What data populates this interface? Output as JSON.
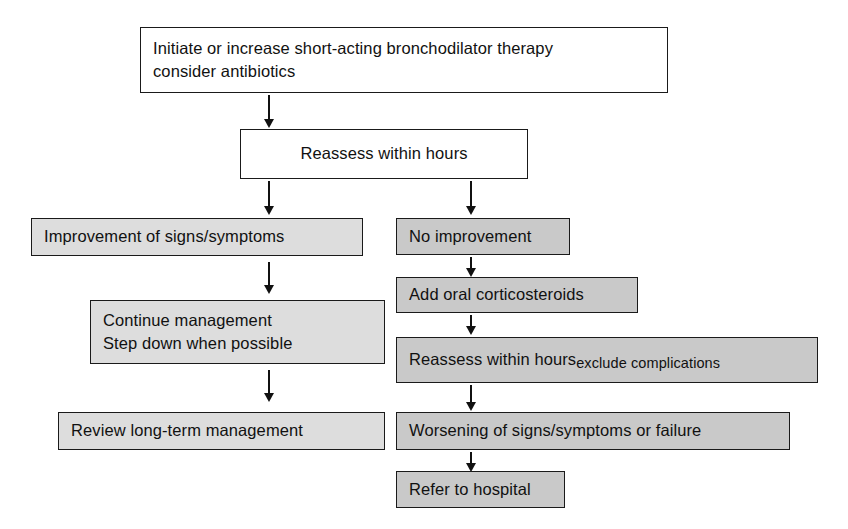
{
  "diagram": {
    "colors": {
      "box_white": "#ffffff",
      "box_light_gray": "#dddddd",
      "box_dark_gray": "#c9c9c9",
      "stroke": "#1a1a1a",
      "text": "#111111",
      "background": "#ffffff"
    },
    "nodes": {
      "start": {
        "line1": "Initiate or increase short-acting bronchodilator therapy",
        "line2": "consider antibiotics"
      },
      "reassess_top": {
        "label": "Reassess within hours"
      },
      "improvement": {
        "label": "Improvement of signs/symptoms"
      },
      "continue_management": {
        "line1": "Continue management",
        "line2": "Step down when possible"
      },
      "review_long_term": {
        "label": "Review long-term management"
      },
      "no_improvement": {
        "label": "No improvement"
      },
      "add_corticosteroids": {
        "label": "Add oral corticosteroids"
      },
      "reassess_exclude": {
        "main": "Reassess within hours",
        "sub": "exclude complications"
      },
      "worsening": {
        "label": "Worsening of signs/symptoms or failure"
      },
      "refer": {
        "label": "Refer to hospital"
      }
    },
    "edges": [
      {
        "name": "start-to-reassess",
        "from": "start",
        "to": "reassess_top"
      },
      {
        "name": "reassess-to-improvement",
        "from": "reassess_top",
        "to": "improvement"
      },
      {
        "name": "reassess-to-no-improvement",
        "from": "reassess_top",
        "to": "no_improvement"
      },
      {
        "name": "improvement-to-continue",
        "from": "improvement",
        "to": "continue_management"
      },
      {
        "name": "continue-to-review",
        "from": "continue_management",
        "to": "review_long_term"
      },
      {
        "name": "no-improvement-to-corticosteroids",
        "from": "no_improvement",
        "to": "add_corticosteroids"
      },
      {
        "name": "corticosteroids-to-reassess",
        "from": "add_corticosteroids",
        "to": "reassess_exclude"
      },
      {
        "name": "reassess-to-worsening",
        "from": "reassess_exclude",
        "to": "worsening"
      },
      {
        "name": "worsening-to-refer",
        "from": "worsening",
        "to": "refer"
      }
    ]
  }
}
